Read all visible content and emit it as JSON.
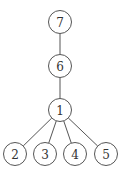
{
  "diagram": {
    "type": "tree",
    "nodes": [
      {
        "id": "7",
        "label": "7",
        "x": 60,
        "y": 22
      },
      {
        "id": "6",
        "label": "6",
        "x": 60,
        "y": 66
      },
      {
        "id": "1",
        "label": "1",
        "x": 60,
        "y": 110
      },
      {
        "id": "2",
        "label": "2",
        "x": 15,
        "y": 154
      },
      {
        "id": "3",
        "label": "3",
        "x": 45,
        "y": 154
      },
      {
        "id": "4",
        "label": "4",
        "x": 75,
        "y": 154
      },
      {
        "id": "5",
        "label": "5",
        "x": 106,
        "y": 154
      }
    ],
    "edges": [
      {
        "from": "7",
        "to": "6"
      },
      {
        "from": "6",
        "to": "1"
      },
      {
        "from": "1",
        "to": "2"
      },
      {
        "from": "1",
        "to": "3"
      },
      {
        "from": "1",
        "to": "4"
      },
      {
        "from": "1",
        "to": "5"
      }
    ],
    "node_radius": 11.5,
    "colors": {
      "stroke": "#555555",
      "fill": "#ffffff",
      "text": "#333333"
    }
  }
}
